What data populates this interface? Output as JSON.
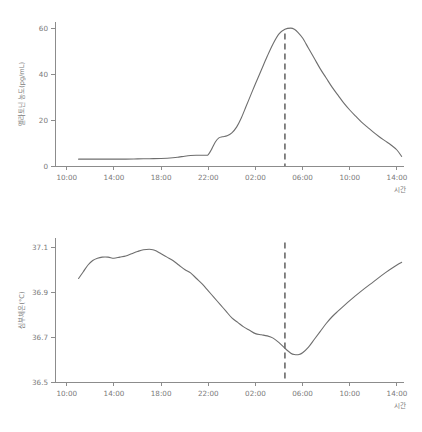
{
  "figure": {
    "background_color": "#ffffff",
    "line_color": "#6e6e6e",
    "axis_color": "#8c8c8c",
    "text_color": "#7a7a7a",
    "marker_color": "#6a6a6a"
  },
  "chart_data": [
    {
      "type": "line",
      "id": "melatonin",
      "title": "",
      "xlabel": "시간",
      "ylabel": "멜라토닌 농도(pg/mL)",
      "xtick_labels": [
        "10:00",
        "14:00",
        "18:00",
        "22:00",
        "02:00",
        "06:00",
        "10:00",
        "14:00"
      ],
      "xtick_hours": [
        10,
        14,
        18,
        22,
        26,
        30,
        34,
        38
      ],
      "ytick_labels": [
        "0",
        "20",
        "40",
        "60"
      ],
      "ytick_values": [
        0,
        20,
        40,
        60
      ],
      "xlim": [
        9,
        38.6
      ],
      "ylim": [
        0,
        63
      ],
      "grid": false,
      "legend": null,
      "annotations": [
        {
          "name": "peak-marker",
          "type": "vertical-dashed-line",
          "x_hour": 28.5,
          "x_label": "04:30",
          "y_from": 0,
          "y_to": 58
        }
      ],
      "x": [
        11.0,
        12.0,
        13.0,
        14.0,
        15.0,
        16.0,
        17.0,
        18.0,
        19.0,
        19.5,
        20.0,
        20.5,
        21.0,
        21.5,
        21.8,
        22.0,
        22.3,
        22.6,
        22.9,
        23.2,
        23.6,
        24.0,
        24.4,
        24.8,
        25.2,
        25.6,
        26.0,
        26.5,
        27.0,
        27.5,
        28.0,
        28.5,
        29.0,
        29.3,
        29.6,
        30.0,
        30.5,
        31.0,
        31.5,
        32.0,
        32.5,
        33.0,
        33.5,
        34.0,
        34.5,
        35.0,
        35.5,
        36.0,
        36.5,
        37.0,
        37.5,
        38.0,
        38.4
      ],
      "values": [
        3.0,
        3.0,
        3.0,
        3.0,
        3.0,
        3.1,
        3.2,
        3.3,
        3.6,
        3.9,
        4.3,
        4.6,
        4.7,
        4.7,
        4.7,
        5.0,
        7.5,
        10.5,
        12.3,
        12.8,
        13.2,
        14.5,
        17.0,
        21.0,
        26.0,
        31.0,
        36.0,
        42.0,
        48.0,
        53.5,
        57.8,
        59.8,
        60.3,
        59.8,
        58.5,
        56.0,
        51.5,
        47.0,
        42.5,
        38.5,
        34.5,
        31.0,
        27.5,
        24.5,
        21.8,
        19.2,
        17.0,
        14.8,
        12.8,
        11.0,
        9.2,
        7.0,
        4.2
      ]
    },
    {
      "type": "line",
      "id": "core-body-temperature",
      "title": "",
      "xlabel": "시간",
      "ylabel": "심부체온(°C)",
      "xtick_labels": [
        "10:00",
        "14:00",
        "18:00",
        "22:00",
        "02:00",
        "06:00",
        "10:00",
        "14:00"
      ],
      "xtick_hours": [
        10,
        14,
        18,
        22,
        26,
        30,
        34,
        38
      ],
      "ytick_labels": [
        "36.5",
        "36.7",
        "36.9",
        "37.1"
      ],
      "ytick_values": [
        36.5,
        36.7,
        36.9,
        37.1
      ],
      "xlim": [
        9,
        38.6
      ],
      "ylim": [
        36.5,
        37.14
      ],
      "grid": false,
      "legend": null,
      "annotations": [
        {
          "name": "nadir-marker",
          "type": "vertical-dashed-line",
          "x_hour": 28.5,
          "x_label": "04:30",
          "y_from": 36.5,
          "y_to": 37.12
        }
      ],
      "x": [
        11.0,
        11.4,
        11.8,
        12.2,
        12.6,
        13.0,
        13.5,
        14.0,
        14.5,
        15.0,
        15.5,
        16.0,
        16.5,
        17.0,
        17.3,
        17.6,
        18.0,
        18.5,
        19.0,
        19.5,
        20.0,
        20.5,
        21.0,
        21.5,
        22.0,
        22.5,
        23.0,
        23.5,
        24.0,
        24.5,
        25.0,
        25.5,
        26.0,
        26.5,
        27.0,
        27.5,
        28.0,
        28.5,
        29.0,
        29.3,
        29.7,
        30.0,
        30.5,
        31.0,
        31.5,
        32.0,
        32.5,
        33.0,
        34.0,
        35.0,
        36.0,
        37.0,
        38.0,
        38.4
      ],
      "values": [
        36.96,
        36.99,
        37.02,
        37.04,
        37.05,
        37.055,
        37.055,
        37.05,
        37.055,
        37.06,
        37.07,
        37.08,
        37.088,
        37.09,
        37.088,
        37.082,
        37.07,
        37.055,
        37.04,
        37.02,
        37.0,
        36.985,
        36.96,
        36.935,
        36.905,
        36.875,
        36.845,
        36.815,
        36.785,
        36.765,
        36.745,
        36.73,
        36.715,
        36.71,
        36.705,
        36.695,
        36.675,
        36.65,
        36.628,
        36.622,
        36.622,
        36.63,
        36.655,
        36.69,
        36.725,
        36.76,
        36.79,
        36.815,
        36.862,
        36.905,
        36.945,
        36.985,
        37.02,
        37.032
      ]
    }
  ]
}
